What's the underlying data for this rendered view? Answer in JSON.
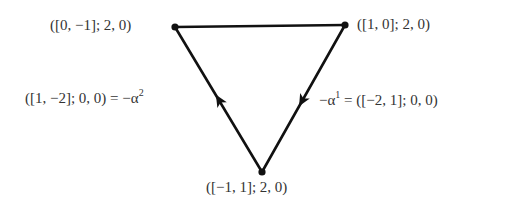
{
  "diagram": {
    "type": "directed-triangle",
    "stroke_color": "#111111",
    "vertices": [
      {
        "id": "top-left",
        "label": "([0, −1]; 2, 0)",
        "x": 175,
        "y": 27
      },
      {
        "id": "top-right",
        "label": "([1, 0]; 2, 0)",
        "x": 345,
        "y": 25
      },
      {
        "id": "bottom",
        "label": "([−1, 1]; 2, 0)",
        "x": 262,
        "y": 172
      }
    ],
    "edges": [
      {
        "from": "top-left",
        "to": "top-right",
        "directed": false,
        "label": ""
      },
      {
        "from": "top-right",
        "to": "bottom",
        "directed": true,
        "arrow_direction": "down",
        "label_prefix": "−α",
        "label_sup": "1",
        "label_suffix": " = ([−2, 1]; 0, 0)"
      },
      {
        "from": "bottom",
        "to": "top-left",
        "directed": true,
        "arrow_direction": "up",
        "label_prefix": "([1, −2]; 0, 0) = −α",
        "label_sup": "2",
        "label_suffix": ""
      }
    ]
  }
}
